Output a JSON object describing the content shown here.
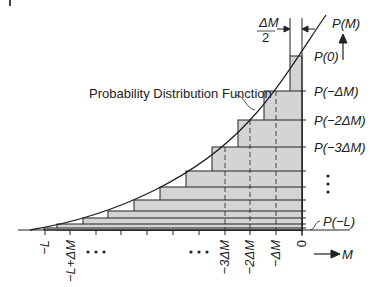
{
  "diagram": {
    "title": "Probability Distribution Function",
    "curve_label": "Probability Distribution Function",
    "y_axis_label": "P(M)",
    "x_axis_label": "M",
    "half_step_label_num": "ΔM",
    "half_step_label_den": "2",
    "step_labels": [
      "P(0)",
      "P(−ΔM)",
      "P(−2ΔM)",
      "P(−3ΔM)",
      "P(−L)"
    ],
    "x_tick_labels": [
      "−L",
      "−L+ΔM",
      "−3ΔM",
      "−2ΔM",
      "−ΔM",
      "0"
    ],
    "ellipsis": "• • •",
    "vertical_ellipsis": "⋮",
    "colors": {
      "fill": "#d4d4d4",
      "stroke": "#222222",
      "background": "#ffffff"
    }
  }
}
